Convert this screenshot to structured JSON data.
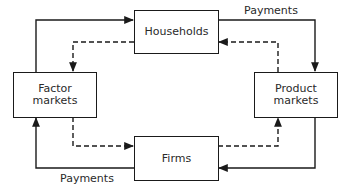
{
  "diagram": {
    "nodes": {
      "households": {
        "label": "Households"
      },
      "factor_markets": {
        "label_line1": "Factor",
        "label_line2": "markets"
      },
      "product_markets": {
        "label_line1": "Product",
        "label_line2": "markets"
      },
      "firms": {
        "label": "Firms"
      }
    },
    "labels": {
      "payments_top": "Payments",
      "payments_bottom": "Payments"
    },
    "edges": [
      {
        "from": "factor_markets",
        "to": "households",
        "style": "solid"
      },
      {
        "from": "households",
        "to": "factor_markets",
        "style": "dashed"
      },
      {
        "from": "households",
        "to": "product_markets",
        "style": "solid",
        "label": "Payments"
      },
      {
        "from": "product_markets",
        "to": "households",
        "style": "dashed"
      },
      {
        "from": "factor_markets",
        "to": "firms",
        "style": "dashed"
      },
      {
        "from": "firms",
        "to": "factor_markets",
        "style": "solid",
        "label": "Payments"
      },
      {
        "from": "firms",
        "to": "product_markets",
        "style": "dashed"
      },
      {
        "from": "product_markets",
        "to": "firms",
        "style": "solid"
      }
    ],
    "colors": {
      "line": "#1a1a1a",
      "text": "#2a2a2a",
      "background": "#ffffff"
    }
  }
}
